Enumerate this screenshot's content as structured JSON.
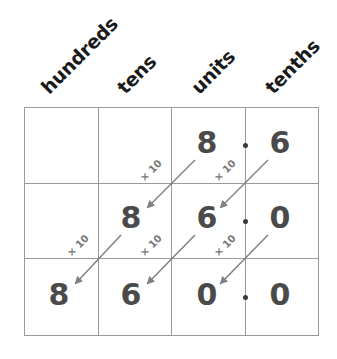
{
  "headers": [
    "hundreds",
    "tens",
    "units",
    "tenths"
  ],
  "grid": {
    "rows": [
      [
        "",
        "",
        "8",
        "6"
      ],
      [
        "",
        "8",
        "6",
        "0"
      ],
      [
        "8",
        "6",
        "0",
        "0"
      ]
    ]
  },
  "multiplier_label": "× 10",
  "colors": {
    "grid_line": "#9a9a9a",
    "digit": "#4a4a4a",
    "arrow": "#808080",
    "header": "#1a1a1a"
  }
}
